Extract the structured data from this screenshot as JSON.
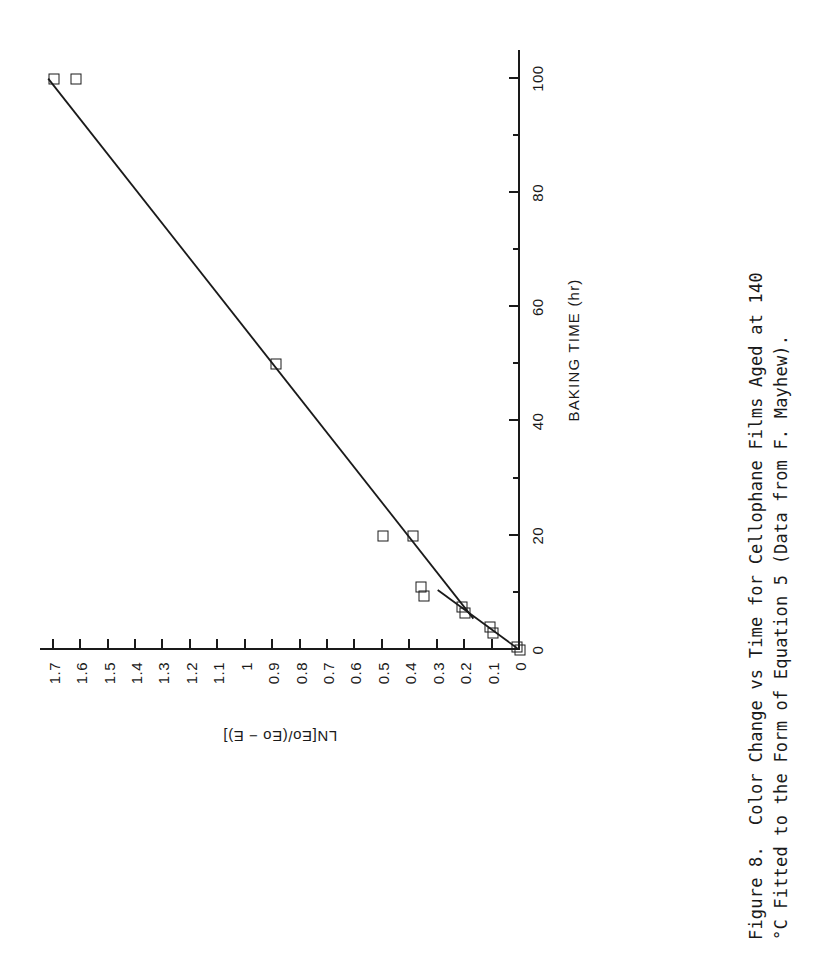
{
  "figure": {
    "caption_line1": "Figure 8.  Color Change vs Time for Cellophane Films Aged at 140",
    "caption_line2": "°C Fitted to the Form of Equation 5 (Data from F. Mayhew)."
  },
  "chart_data": {
    "type": "scatter",
    "title": "",
    "xlabel": "BAKING TIME  (hr)",
    "ylabel": "LN[Eo/(Eo − E)]",
    "xlim": [
      0,
      105
    ],
    "ylim": [
      0,
      1.75
    ],
    "grid": false,
    "legend": "none",
    "orientation": "page-rotated-90-ccw",
    "x_major_ticks": [
      0,
      20,
      40,
      60,
      80,
      100
    ],
    "x_major_tick_labels": [
      "0",
      "20",
      "40",
      "60",
      "80",
      "100"
    ],
    "x_minor_ticks": [
      10,
      30,
      50,
      70,
      90
    ],
    "y_major_ticks": [
      0,
      0.1,
      0.2,
      0.3,
      0.4,
      0.5,
      0.6,
      0.7,
      0.8,
      0.9,
      1,
      1.1,
      1.2,
      1.3,
      1.4,
      1.5,
      1.6,
      1.7
    ],
    "y_major_tick_labels": [
      "0",
      "0.1",
      "0.2",
      "0.3",
      "0.4",
      "0.5",
      "0.6",
      "0.7",
      "0.8",
      "0.9",
      "1",
      "1.1",
      "1.2",
      "1.3",
      "1.4",
      "1.5",
      "1.6",
      "1.7"
    ],
    "marker": "open-square",
    "points": [
      {
        "x": 0,
        "y": 0.0
      },
      {
        "x": 0.5,
        "y": 0.01
      },
      {
        "x": 3,
        "y": 0.1
      },
      {
        "x": 4,
        "y": 0.11
      },
      {
        "x": 6.5,
        "y": 0.2
      },
      {
        "x": 7.5,
        "y": 0.21
      },
      {
        "x": 9.5,
        "y": 0.35
      },
      {
        "x": 11,
        "y": 0.36
      },
      {
        "x": 20,
        "y": 0.39
      },
      {
        "x": 20,
        "y": 0.5
      },
      {
        "x": 50,
        "y": 0.89
      },
      {
        "x": 100,
        "y": 1.62
      },
      {
        "x": 100,
        "y": 1.7
      }
    ],
    "fit_lines": [
      {
        "name": "equation-5-fit-main",
        "points": [
          [
            5.5,
            0.17
          ],
          [
            100,
            1.72
          ]
        ]
      },
      {
        "name": "equation-5-fit-lower",
        "points": [
          [
            0.3,
            0.01
          ],
          [
            10.5,
            0.3
          ]
        ]
      }
    ]
  }
}
